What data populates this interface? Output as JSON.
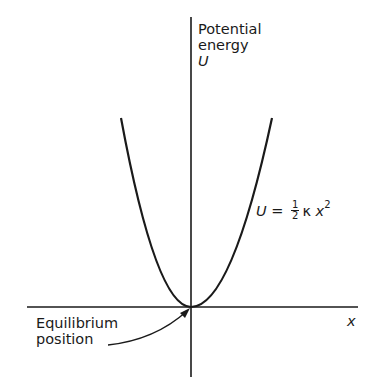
{
  "diagram": {
    "y_axis_label": {
      "line1": "Potential",
      "line2": "energy",
      "symbol": "U"
    },
    "x_axis_label": "x",
    "curve_equation": {
      "lhs": "U",
      "equals": "=",
      "frac_num": "1",
      "frac_den": "2",
      "kappa": "κ",
      "var": "x",
      "exp": "2"
    },
    "annotation": {
      "line1": "Equilibrium",
      "line2": "position"
    },
    "colors": {
      "ink": "#1a1a1a",
      "background": "#ffffff"
    }
  }
}
